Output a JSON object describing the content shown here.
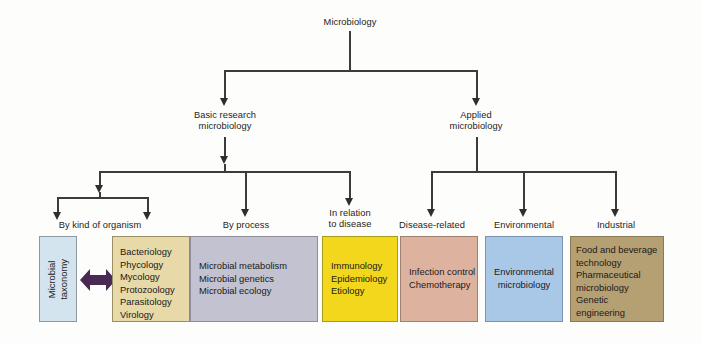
{
  "diagram": {
    "title": "Microbiology",
    "root": {
      "label": "Microbiology"
    },
    "level2": [
      {
        "label": "Basic research\nmicrobiology"
      },
      {
        "label": "Applied\nmicrobiology"
      }
    ],
    "level3": [
      {
        "label": "By kind of organism"
      },
      {
        "label": "By process"
      },
      {
        "label": "In relation\nto disease"
      },
      {
        "label": "Disease-related"
      },
      {
        "label": "Environmental"
      },
      {
        "label": "Industrial"
      }
    ],
    "boxes": [
      {
        "name": "microbial-taxonomy",
        "text": "Microbial\ntaxonomy",
        "color": "#d4e4ee",
        "border": "#8d9aa2"
      },
      {
        "name": "kind-of-organism-list",
        "text": "Bacteriology\nPhycology\nMycology\nProtozoology\nParasitology\nVirology",
        "color": "#e8d9a8",
        "border": "#9a8f63"
      },
      {
        "name": "by-process-list",
        "text": "Microbial metabolism\nMicrobial genetics\nMicrobial ecology",
        "color": "#c3c2d0",
        "border": "#8e8d99"
      },
      {
        "name": "in-relation-to-disease-list",
        "text": "Immunology\nEpidemiology\nEtiology",
        "color": "#f2d71d",
        "border": "#a89a1b"
      },
      {
        "name": "disease-related-list",
        "text": "Infection control\nChemotherapy",
        "color": "#ddb3a0",
        "border": "#a08070"
      },
      {
        "name": "environmental-list",
        "text": "Environmental\nmicrobiology",
        "color": "#a9c8e8",
        "border": "#7b93ac"
      },
      {
        "name": "industrial-list",
        "text": "Food and beverage\n  technology\nPharmaceutical\n  microbiology\nGenetic\n  engineering",
        "color": "#b5a074",
        "border": "#8b7a55"
      }
    ],
    "connector": {
      "double_arrow_color": "#4a2a55",
      "line_color": "#3b3b3b"
    }
  }
}
